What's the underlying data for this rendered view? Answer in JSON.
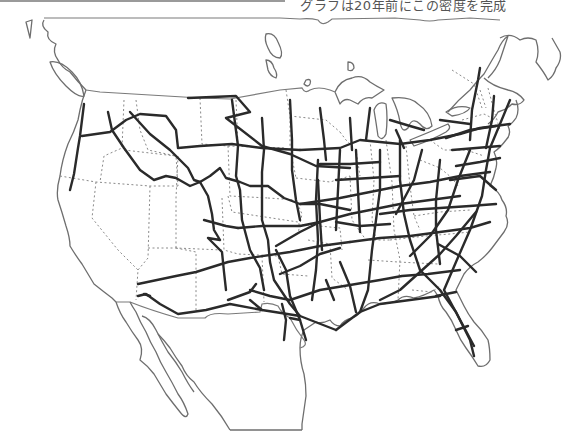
{
  "header": {
    "caption": "グラフは20年前にこの密度を完成"
  },
  "map": {
    "subject": "United States interstate highway network",
    "region": "Contiguous United States with southern Canada and northern Mexico outline",
    "layers": [
      {
        "name": "coastline-and-national-borders",
        "style": "thin gray solid line"
      },
      {
        "name": "state-borders",
        "style": "dotted gray line"
      },
      {
        "name": "interstate-highways",
        "style": "thick dark solid line"
      }
    ],
    "colors": {
      "background": "#ffffff",
      "highway": "#2a2a2a",
      "coast": "#6e6e6e",
      "state_border": "#8a8a8a"
    }
  }
}
